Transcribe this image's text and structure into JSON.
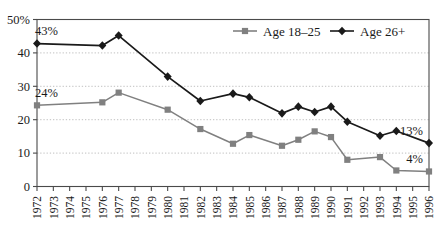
{
  "chart_data": {
    "type": "line",
    "title": "",
    "xlabel": "",
    "ylabel": "",
    "x": [
      "1972",
      "1973",
      "1974",
      "1975",
      "1976",
      "1977",
      "1978",
      "1979",
      "1980",
      "1981",
      "1982",
      "1983",
      "1984",
      "1985",
      "1986",
      "1987",
      "1988",
      "1989",
      "1990",
      "1991",
      "1992",
      "1993",
      "1994",
      "1995",
      "1996"
    ],
    "xtick_labels": [
      "1972",
      "1973",
      "1974",
      "1975",
      "1976",
      "1977",
      "1978",
      "1979",
      "1980",
      "1981",
      "1982",
      "1983",
      "1984",
      "1985",
      "1986",
      "1987",
      "1988",
      "1989",
      "1990",
      "1991",
      "1992",
      "1993",
      "1994",
      "1995",
      "1996"
    ],
    "ytick_labels": [
      "0",
      "10",
      "20",
      "30",
      "40",
      "50%"
    ],
    "yticks": [
      0,
      10,
      20,
      30,
      40,
      50
    ],
    "ylim": [
      0,
      50
    ],
    "grid": true,
    "grid_axis": "y",
    "legend_position": "top-right",
    "series": [
      {
        "name": "Age 18–25",
        "color": "#808080",
        "marker": "square",
        "points": [
          {
            "x": "1972",
            "y": 24.3
          },
          {
            "x": "1976",
            "y": 25.2
          },
          {
            "x": "1977",
            "y": 28.1
          },
          {
            "x": "1980",
            "y": 23.0
          },
          {
            "x": "1982",
            "y": 17.2
          },
          {
            "x": "1984",
            "y": 12.8
          },
          {
            "x": "1985",
            "y": 15.4
          },
          {
            "x": "1987",
            "y": 12.2
          },
          {
            "x": "1988",
            "y": 14.0
          },
          {
            "x": "1989",
            "y": 16.5
          },
          {
            "x": "1990",
            "y": 14.8
          },
          {
            "x": "1991",
            "y": 8.0
          },
          {
            "x": "1993",
            "y": 8.8
          },
          {
            "x": "1994",
            "y": 4.8
          },
          {
            "x": "1996",
            "y": 4.5
          }
        ]
      },
      {
        "name": "Age 26+",
        "color": "#1a1a1a",
        "marker": "diamond",
        "points": [
          {
            "x": "1972",
            "y": 42.8
          },
          {
            "x": "1976",
            "y": 42.2
          },
          {
            "x": "1977",
            "y": 45.2
          },
          {
            "x": "1980",
            "y": 32.9
          },
          {
            "x": "1982",
            "y": 25.6
          },
          {
            "x": "1984",
            "y": 27.8
          },
          {
            "x": "1985",
            "y": 26.7
          },
          {
            "x": "1987",
            "y": 21.9
          },
          {
            "x": "1988",
            "y": 23.9
          },
          {
            "x": "1989",
            "y": 22.3
          },
          {
            "x": "1990",
            "y": 23.9
          },
          {
            "x": "1991",
            "y": 19.4
          },
          {
            "x": "1993",
            "y": 15.2
          },
          {
            "x": "1994",
            "y": 16.6
          },
          {
            "x": "1996",
            "y": 13.0
          }
        ]
      }
    ],
    "annotations": [
      {
        "text": "43%",
        "x": "1972",
        "y": 42.8,
        "series": "Age 26+",
        "position": "above-left"
      },
      {
        "text": "24%",
        "x": "1972",
        "y": 24.3,
        "series": "Age 18–25",
        "position": "above-left"
      },
      {
        "text": "13%",
        "x": "1996",
        "y": 13.0,
        "series": "Age 26+",
        "position": "above-left"
      },
      {
        "text": "4%",
        "x": "1996",
        "y": 4.5,
        "series": "Age 18–25",
        "position": "above-left"
      }
    ]
  },
  "legend": {
    "items": [
      {
        "label": "Age 18–25",
        "color": "#808080",
        "marker": "square"
      },
      {
        "label": "Age 26+",
        "color": "#1a1a1a",
        "marker": "diamond"
      }
    ]
  },
  "colors": {
    "series_young": "#808080",
    "series_old": "#1a1a1a",
    "grid": "#b0b0b0",
    "frame": "#4a4a4a",
    "text": "#1a1a1a",
    "background": "#ffffff"
  }
}
